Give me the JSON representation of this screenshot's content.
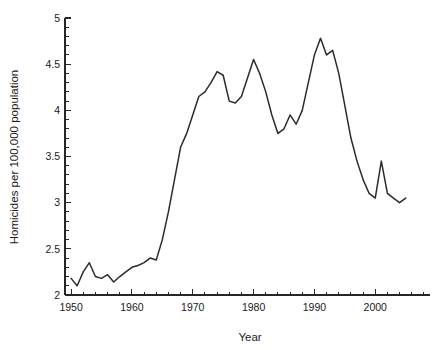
{
  "chart_data": {
    "type": "line",
    "title": "",
    "xlabel": "Year",
    "ylabel": "Homicides per 100,000 population",
    "xlim": [
      1949,
      2009
    ],
    "ylim": [
      2,
      5
    ],
    "grid": false,
    "legend": "none",
    "x_ticks_major": [
      1950,
      1960,
      1970,
      1980,
      1990,
      2000
    ],
    "x_tick_labels": [
      "1950",
      "1960",
      "1970",
      "1980",
      "1990",
      "2000"
    ],
    "x_minor_step": 2,
    "y_ticks_major": [
      2,
      2.5,
      3,
      3.5,
      4,
      4.5,
      5
    ],
    "y_tick_labels": [
      "2",
      "2.5",
      "3",
      "3.5",
      "4",
      "4.5",
      "5"
    ],
    "y_minor_step": 0.1,
    "series": [
      {
        "name": "Homicide rate",
        "color": "#2b2b2b",
        "x": [
          1950,
          1951,
          1952,
          1953,
          1954,
          1955,
          1956,
          1957,
          1958,
          1959,
          1960,
          1961,
          1962,
          1963,
          1964,
          1965,
          1966,
          1967,
          1968,
          1969,
          1970,
          1971,
          1972,
          1973,
          1974,
          1975,
          1976,
          1977,
          1978,
          1979,
          1980,
          1981,
          1982,
          1983,
          1984,
          1985,
          1986,
          1987,
          1988,
          1989,
          1990,
          1991,
          1992,
          1993,
          1994,
          1995,
          1996,
          1997,
          1998,
          1999,
          2000,
          2001,
          2002,
          2003,
          2004,
          2005
        ],
        "values": [
          2.18,
          2.1,
          2.25,
          2.35,
          2.2,
          2.18,
          2.22,
          2.14,
          2.2,
          2.25,
          2.3,
          2.32,
          2.35,
          2.4,
          2.38,
          2.6,
          2.9,
          3.25,
          3.6,
          3.75,
          3.95,
          4.15,
          4.2,
          4.3,
          4.42,
          4.38,
          4.1,
          4.08,
          4.15,
          4.35,
          4.55,
          4.4,
          4.2,
          3.95,
          3.75,
          3.8,
          3.95,
          3.85,
          4.0,
          4.3,
          4.6,
          4.78,
          4.6,
          4.65,
          4.4,
          4.05,
          3.7,
          3.45,
          3.25,
          3.1,
          3.05,
          3.45,
          3.1,
          3.05,
          3.0,
          3.05
        ]
      }
    ],
    "geometry": {
      "plot_left_px": 65,
      "plot_right_px": 430,
      "plot_top_px": 18,
      "plot_bottom_px": 295
    }
  }
}
